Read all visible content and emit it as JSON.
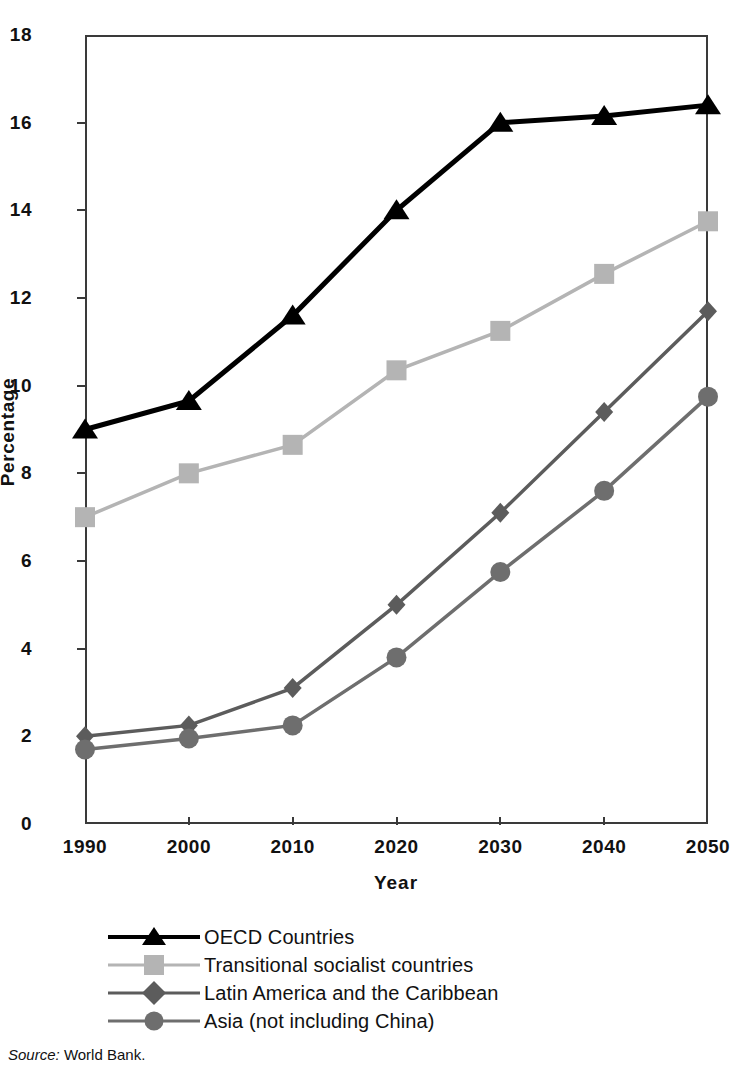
{
  "chart_data": {
    "type": "line",
    "title": "",
    "xlabel": "Year",
    "ylabel": "Percentage",
    "x": [
      1990,
      2000,
      2010,
      2020,
      2030,
      2040,
      2050
    ],
    "xtick_labels": [
      "1990",
      "2000",
      "2010",
      "2020",
      "2030",
      "2040",
      "2050"
    ],
    "ytick_labels": [
      "0",
      "2",
      "4",
      "6",
      "8",
      "10",
      "12",
      "14",
      "16",
      "18"
    ],
    "yticks": [
      0,
      2,
      4,
      6,
      8,
      10,
      12,
      14,
      16,
      18
    ],
    "ylim": [
      0,
      18
    ],
    "xlim": [
      1990,
      2050
    ],
    "grid": false,
    "legend_position": "below-axes",
    "series": [
      {
        "name": "OECD Countries",
        "marker": "triangle",
        "color": "#000000",
        "values": [
          9.0,
          9.65,
          11.6,
          14.0,
          16.0,
          16.15,
          16.4
        ]
      },
      {
        "name": "Transitional socialist countries",
        "marker": "square",
        "color": "#b4b4b4",
        "values": [
          7.0,
          8.0,
          8.65,
          10.35,
          11.25,
          12.55,
          13.75
        ]
      },
      {
        "name": "Latin America and the Caribbean",
        "marker": "diamond",
        "color": "#5c5c5c",
        "values": [
          2.0,
          2.25,
          3.1,
          5.0,
          7.1,
          9.4,
          11.7
        ]
      },
      {
        "name": "Asia (not including China)",
        "marker": "circle",
        "color": "#6e6e6e",
        "values": [
          1.7,
          1.95,
          2.25,
          3.8,
          5.75,
          7.6,
          9.75
        ]
      }
    ]
  },
  "source": {
    "prefix": "Source:",
    "text": "World Bank."
  }
}
